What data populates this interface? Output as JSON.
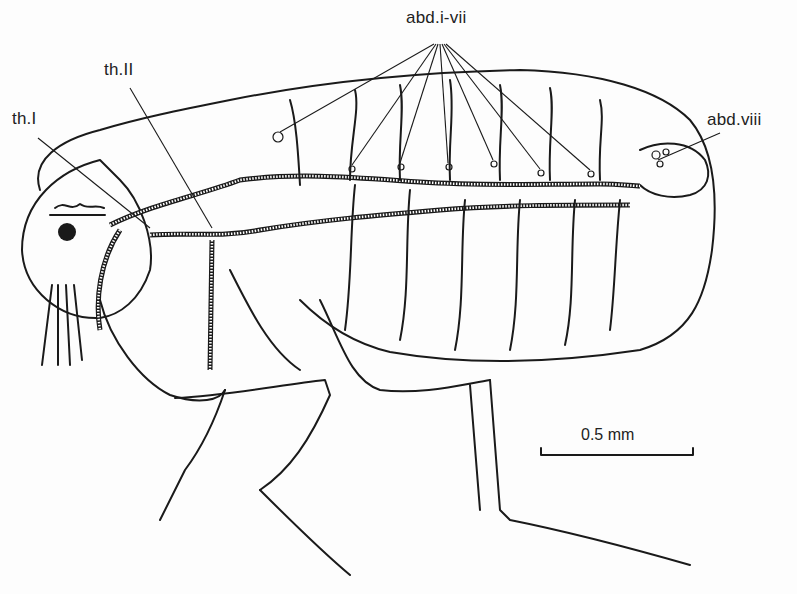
{
  "figure": {
    "labels": {
      "abdominal_spiracles": "abd.i-vii",
      "thoracic_spiracle_2": "th.II",
      "thoracic_spiracle_1": "th.I",
      "abdominal_spiracle_8": "abd.viii"
    },
    "scale_bar": {
      "label": "0.5 mm",
      "length_px": 152
    },
    "colors": {
      "ink": "#1a1a1a",
      "background": "#fdfdfd"
    }
  }
}
